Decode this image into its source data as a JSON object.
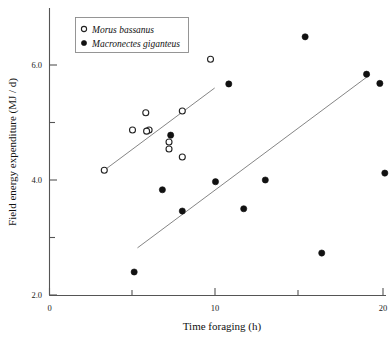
{
  "chart_data": {
    "type": "scatter",
    "title": "",
    "xlabel": "Time foraging (h)",
    "ylabel": "Field energy expenditure (MJ / d)",
    "xlim": [
      0,
      20.6
    ],
    "ylim": [
      2.0,
      6.9
    ],
    "xticks_major": [
      0,
      10,
      20
    ],
    "xticks_minor": [
      5,
      15
    ],
    "xtick_labels": [
      "0",
      "10",
      "20"
    ],
    "yticks_major": [
      2.0,
      4.0,
      6.0
    ],
    "yticks_minor": [
      3.0,
      5.0
    ],
    "ytick_labels": [
      "2.0",
      "4.0",
      "6.0"
    ],
    "grid": false,
    "legend_position": "top-left",
    "series": [
      {
        "name": "Morus bassanus",
        "marker": "open-circle",
        "color": "#222222",
        "points": [
          {
            "x": 3.3,
            "y": 4.17
          },
          {
            "x": 5.0,
            "y": 4.87
          },
          {
            "x": 5.8,
            "y": 5.17
          },
          {
            "x": 6.0,
            "y": 4.87
          },
          {
            "x": 5.85,
            "y": 4.85
          },
          {
            "x": 7.2,
            "y": 4.66
          },
          {
            "x": 7.2,
            "y": 4.54
          },
          {
            "x": 8.0,
            "y": 5.2
          },
          {
            "x": 8.0,
            "y": 4.4
          },
          {
            "x": 9.7,
            "y": 6.1
          }
        ]
      },
      {
        "name": "Macronectes giganteus",
        "marker": "filled-circle",
        "color": "#111111",
        "points": [
          {
            "x": 5.1,
            "y": 2.4
          },
          {
            "x": 6.8,
            "y": 3.83
          },
          {
            "x": 7.3,
            "y": 4.78
          },
          {
            "x": 8.0,
            "y": 3.46
          },
          {
            "x": 10.8,
            "y": 5.67
          },
          {
            "x": 10.0,
            "y": 3.97
          },
          {
            "x": 11.7,
            "y": 3.5
          },
          {
            "x": 13.0,
            "y": 4.0
          },
          {
            "x": 15.4,
            "y": 6.49
          },
          {
            "x": 16.4,
            "y": 2.73
          },
          {
            "x": 19.1,
            "y": 5.84
          },
          {
            "x": 19.9,
            "y": 5.68
          },
          {
            "x": 20.2,
            "y": 4.12
          }
        ]
      }
    ],
    "fit_lines": [
      {
        "series": "Morus bassanus",
        "x0": 3.3,
        "y0": 4.17,
        "x1": 9.95,
        "y1": 5.6
      },
      {
        "series": "Macronectes giganteus",
        "x0": 5.3,
        "y0": 2.82,
        "x1": 19.3,
        "y1": 5.83
      }
    ]
  },
  "legend": {
    "entries": [
      {
        "label": "Morus bassanus",
        "marker": "open-circle"
      },
      {
        "label": "Macronectes giganteus",
        "marker": "filled-circle"
      }
    ]
  },
  "axes": {
    "x_title": "Time foraging (h)",
    "y_title": "Field energy expenditure (MJ / d)",
    "x_tick_labels": [
      "0",
      "10",
      "20"
    ],
    "y_tick_labels": [
      "2.0",
      "4.0",
      "6.0"
    ]
  }
}
